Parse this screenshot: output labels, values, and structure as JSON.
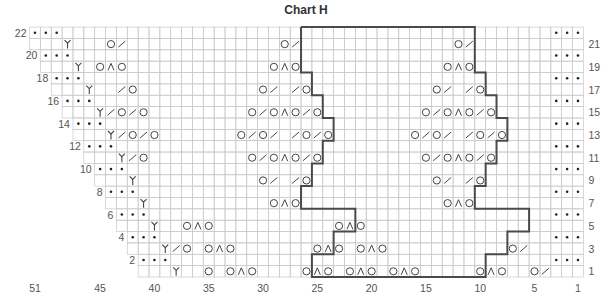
{
  "title": "Chart H",
  "grid": {
    "columns": 51,
    "rows": 22,
    "right_edge_x": 583.4,
    "bottom_edge_y": 277,
    "cell_w": 10.86,
    "cell_h": 11.36,
    "grid_color": "#c9c9c9",
    "outline_color": "#4a4a4a",
    "symbol_color": "#444444"
  },
  "row_labels_left": [
    22,
    20,
    18,
    16,
    14,
    12,
    10,
    8,
    6,
    4,
    2
  ],
  "row_labels_right": [
    21,
    19,
    17,
    15,
    13,
    11,
    9,
    7,
    5,
    3,
    1
  ],
  "column_labels": [
    {
      "col": 51,
      "label": "51"
    },
    {
      "col": 45,
      "label": "45"
    },
    {
      "col": 40,
      "label": "40"
    },
    {
      "col": 35,
      "label": "35"
    },
    {
      "col": 30,
      "label": "30"
    },
    {
      "col": 25,
      "label": "25"
    },
    {
      "col": 20,
      "label": "20"
    },
    {
      "col": 15,
      "label": "15"
    },
    {
      "col": 10,
      "label": "10"
    },
    {
      "col": 5,
      "label": "5"
    },
    {
      "col": 1,
      "label": "1"
    }
  ],
  "legend_symbols": {
    "dot": "purl",
    "O": "yarn over",
    "/": "k2tog",
    "^": "central double decrease",
    "Y": "decrease / bind-off edge stitch"
  },
  "rows": [
    {
      "row": 22,
      "start_col": 51,
      "cells": {
        "51": "dot",
        "50": "dot",
        "49": "dot",
        "1": "dot",
        "2": "dot",
        "3": "dot"
      }
    },
    {
      "row": 21,
      "start_col": 51,
      "cells": {
        "48": "Y",
        "44": "O",
        "43": "/",
        "28": "O",
        "27": "/",
        "12": "O",
        "11": "/"
      }
    },
    {
      "row": 20,
      "start_col": 50,
      "cells": {
        "50": "dot",
        "49": "dot",
        "48": "dot",
        "1": "dot",
        "2": "dot",
        "3": "dot"
      }
    },
    {
      "row": 19,
      "start_col": 50,
      "cells": {
        "47": "Y",
        "45": "O",
        "44": "^",
        "43": "O",
        "29": "O",
        "28": "^",
        "27": "O",
        "13": "O",
        "12": "^",
        "11": "O"
      }
    },
    {
      "row": 18,
      "start_col": 49,
      "cells": {
        "49": "dot",
        "48": "dot",
        "47": "dot",
        "1": "dot",
        "2": "dot",
        "3": "dot"
      }
    },
    {
      "row": 17,
      "start_col": 49,
      "cells": {
        "46": "Y",
        "43": "/",
        "42": "O",
        "30": "O",
        "29": "/",
        "27": "/",
        "26": "O",
        "14": "O",
        "13": "/",
        "11": "/",
        "10": "O"
      }
    },
    {
      "row": 16,
      "start_col": 48,
      "cells": {
        "48": "dot",
        "47": "dot",
        "46": "dot",
        "1": "dot",
        "2": "dot",
        "3": "dot"
      }
    },
    {
      "row": 15,
      "start_col": 48,
      "cells": {
        "45": "Y",
        "44": "/",
        "43": "O",
        "42": "/",
        "41": "O",
        "31": "O",
        "30": "/",
        "29": "O",
        "28": "^",
        "27": "O",
        "26": "/",
        "25": "O",
        "15": "O",
        "14": "/",
        "13": "O",
        "12": "^",
        "11": "O",
        "10": "/",
        "9": "O"
      }
    },
    {
      "row": 14,
      "start_col": 47,
      "cells": {
        "47": "dot",
        "46": "dot",
        "45": "dot",
        "1": "dot",
        "2": "dot",
        "3": "dot"
      }
    },
    {
      "row": 13,
      "start_col": 47,
      "cells": {
        "44": "Y",
        "43": "/",
        "42": "O",
        "41": "/",
        "40": "O",
        "32": "O",
        "31": "/",
        "30": "O",
        "29": "/",
        "27": "/",
        "26": "O",
        "25": "/",
        "24": "O",
        "16": "O",
        "15": "/",
        "14": "O",
        "13": "/",
        "11": "/",
        "10": "O",
        "9": "/",
        "8": "O"
      }
    },
    {
      "row": 12,
      "start_col": 46,
      "cells": {
        "46": "dot",
        "45": "dot",
        "44": "dot",
        "1": "dot",
        "2": "dot",
        "3": "dot"
      }
    },
    {
      "row": 11,
      "start_col": 46,
      "cells": {
        "43": "Y",
        "42": "/",
        "41": "O",
        "31": "O",
        "30": "/",
        "29": "O",
        "28": "^",
        "27": "O",
        "26": "/",
        "25": "O",
        "15": "O",
        "14": "/",
        "13": "O",
        "12": "^",
        "11": "O",
        "10": "/",
        "9": "O"
      }
    },
    {
      "row": 10,
      "start_col": 45,
      "cells": {
        "45": "dot",
        "44": "dot",
        "43": "dot",
        "1": "dot",
        "2": "dot",
        "3": "dot"
      }
    },
    {
      "row": 9,
      "start_col": 45,
      "cells": {
        "42": "Y",
        "30": "O",
        "29": "/",
        "27": "/",
        "26": "O",
        "14": "O",
        "13": "/",
        "11": "/",
        "10": "O"
      }
    },
    {
      "row": 8,
      "start_col": 44,
      "cells": {
        "44": "dot",
        "43": "dot",
        "42": "dot",
        "1": "dot",
        "2": "dot",
        "3": "dot"
      }
    },
    {
      "row": 7,
      "start_col": 44,
      "cells": {
        "41": "Y",
        "29": "O",
        "28": "^",
        "27": "O",
        "13": "O",
        "12": "^",
        "11": "O"
      }
    },
    {
      "row": 6,
      "start_col": 43,
      "cells": {
        "43": "dot",
        "42": "dot",
        "41": "dot",
        "1": "dot",
        "2": "dot",
        "3": "dot"
      }
    },
    {
      "row": 5,
      "start_col": 43,
      "cells": {
        "40": "Y",
        "37": "O",
        "36": "^",
        "35": "O",
        "23": "O",
        "22": "^",
        "21": "O"
      }
    },
    {
      "row": 4,
      "start_col": 42,
      "cells": {
        "42": "dot",
        "41": "dot",
        "40": "dot",
        "1": "dot",
        "2": "dot",
        "3": "dot"
      }
    },
    {
      "row": 3,
      "start_col": 42,
      "cells": {
        "39": "Y",
        "38": "/",
        "37": "O",
        "35": "O",
        "34": "^",
        "33": "O",
        "25": "O",
        "24": "^",
        "23": "O",
        "21": "O",
        "20": "^",
        "19": "O",
        "7": "O",
        "6": "/"
      }
    },
    {
      "row": 2,
      "start_col": 41,
      "cells": {
        "41": "dot",
        "40": "dot",
        "39": "dot",
        "1": "dot",
        "2": "dot",
        "3": "dot"
      }
    },
    {
      "row": 1,
      "start_col": 41,
      "cells": {
        "38": "Y",
        "35": "O",
        "33": "O",
        "32": "^",
        "31": "O",
        "26": "O",
        "25": "^",
        "24": "O",
        "22": "O",
        "21": "^",
        "20": "O",
        "18": "O",
        "17": "^",
        "16": "O",
        "10": "O",
        "9": "^",
        "8": "O",
        "5": "O",
        "4": "/"
      }
    }
  ],
  "outline": {
    "comment_free_segments": true,
    "pairs": [
      {
        "rows": [
          22,
          21
        ],
        "left_b": 26,
        "right_b": 10
      },
      {
        "rows": [
          20,
          19
        ],
        "left_b": 26,
        "right_b": 10
      },
      {
        "rows": [
          18,
          17
        ],
        "left_b": 25,
        "right_b": 9
      },
      {
        "rows": [
          16,
          15
        ],
        "left_b": 24,
        "right_b": 8
      },
      {
        "rows": [
          14,
          13
        ],
        "left_b": 23,
        "right_b": 7
      },
      {
        "rows": [
          12,
          11
        ],
        "left_b": 24,
        "right_b": 8
      },
      {
        "rows": [
          10,
          9
        ],
        "left_b": 25,
        "right_b": 9
      },
      {
        "rows": [
          8,
          7
        ],
        "left_b": 26,
        "right_b": 10
      },
      {
        "rows": [
          6,
          5
        ],
        "left_b": 21,
        "right_b": 5
      },
      {
        "rows": [
          4,
          3
        ],
        "left_b": 23,
        "right_b": 7
      },
      {
        "rows": [
          2,
          1
        ],
        "left_b": 25,
        "right_b": 9
      }
    ]
  }
}
